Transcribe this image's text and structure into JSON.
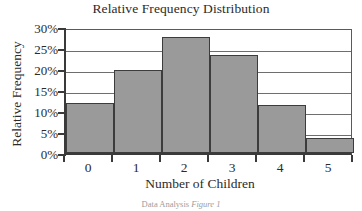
{
  "chart_data": {
    "type": "bar",
    "title": "Relative Frequency Distribution",
    "xlabel": "Number of Children",
    "ylabel": "Relative Frequency",
    "categories": [
      "0",
      "1",
      "2",
      "3",
      "4",
      "5"
    ],
    "values": [
      11.8,
      19.8,
      27.7,
      23.4,
      11.5,
      3.5
    ],
    "value_unit": "%",
    "ylim": [
      0,
      30
    ],
    "ytick_labels": [
      "0%",
      "5%",
      "10%",
      "15%",
      "20%",
      "25%",
      "30%"
    ],
    "ytick_values": [
      0,
      5,
      10,
      15,
      20,
      25,
      30
    ],
    "xtick_labels": [
      "0",
      "1",
      "2",
      "3",
      "4",
      "5"
    ],
    "grid": "horizontal",
    "legend": "none",
    "bar_color": "#9a9a9a",
    "bar_edge_color": "#3c3c3c",
    "axis_color": "#3a3a3a",
    "gridline_color": "#6e6e6e",
    "background_color": "#ffffff",
    "series": [
      {
        "name": "Relative Frequency",
        "values": [
          11.8,
          19.8,
          27.7,
          23.4,
          11.5,
          3.5
        ]
      }
    ],
    "points": [
      {
        "category": "0",
        "value": 11.8
      },
      {
        "category": "1",
        "value": 19.8
      },
      {
        "category": "2",
        "value": 27.7
      },
      {
        "category": "3",
        "value": 23.4
      },
      {
        "category": "4",
        "value": 11.5
      },
      {
        "category": "5",
        "value": 3.5
      }
    ]
  },
  "caption": {
    "prefix": "Data Analysis ",
    "emphasis": "Figure 1",
    "full": "Data Analysis Figure 1"
  }
}
